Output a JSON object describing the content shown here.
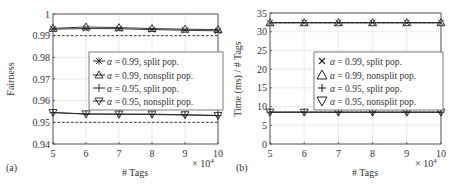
{
  "chart_data": [
    {
      "panel": "(a)",
      "type": "line",
      "xlabel": "# Tags",
      "ylabel": "Fairness",
      "x_multiplier": "× 10^4",
      "x": [
        5,
        6,
        7,
        8,
        9,
        10
      ],
      "x_ticks": [
        "5",
        "6",
        "7",
        "8",
        "9",
        "10"
      ],
      "ylim": [
        0.94,
        1.0
      ],
      "y_ticks": [
        "0.94",
        "0.95",
        "0.96",
        "0.97",
        "0.98",
        "0.99",
        "1"
      ],
      "y_tick_values": [
        0.94,
        0.95,
        0.96,
        0.97,
        0.98,
        0.99,
        1.0
      ],
      "grid": true,
      "reference_lines": [
        0.99,
        0.95
      ],
      "legend_position": "center-right",
      "series": [
        {
          "name": "α = 0.99, split pop.",
          "marker": "asterisk",
          "values": [
            0.993,
            0.9933,
            0.9932,
            0.9928,
            0.9925,
            0.9922
          ]
        },
        {
          "name": "α = 0.99, nonsplit pop.",
          "marker": "triangle-up",
          "values": [
            0.9934,
            0.994,
            0.9937,
            0.9933,
            0.993,
            0.9928
          ]
        },
        {
          "name": "α = 0.95, split pop.",
          "marker": "plus",
          "values": [
            0.9545,
            0.9538,
            0.9537,
            0.9536,
            0.9534,
            0.9531
          ]
        },
        {
          "name": "α = 0.95, nonsplit pop.",
          "marker": "triangle-down",
          "values": [
            0.9545,
            0.9539,
            0.9538,
            0.9538,
            0.9535,
            0.9532
          ]
        }
      ]
    },
    {
      "panel": "(b)",
      "type": "line",
      "xlabel": "# Tags",
      "ylabel": "Time (ms) / # Tags",
      "x_multiplier": "× 10^4",
      "x": [
        5,
        6,
        7,
        8,
        9,
        10
      ],
      "x_ticks": [
        "5",
        "6",
        "7",
        "8",
        "9",
        "10"
      ],
      "ylim": [
        0,
        35
      ],
      "y_ticks": [
        "0",
        "5",
        "10",
        "15",
        "20",
        "25",
        "30",
        "35"
      ],
      "y_tick_values": [
        0,
        5,
        10,
        15,
        20,
        25,
        30,
        35
      ],
      "grid": true,
      "reference_lines": [
        32.4,
        8.5
      ],
      "legend_position": "center-right",
      "series": [
        {
          "name": "α = 0.99, split pop.",
          "marker": "x",
          "values": [
            32.4,
            32.4,
            32.4,
            32.4,
            32.4,
            32.4
          ]
        },
        {
          "name": "α = 0.99, nonsplit pop.",
          "marker": "triangle-up",
          "values": [
            32.4,
            32.4,
            32.4,
            32.4,
            32.4,
            32.4
          ]
        },
        {
          "name": "α = 0.95, split pop.",
          "marker": "plus",
          "values": [
            8.5,
            8.5,
            8.5,
            8.5,
            8.5,
            8.5
          ]
        },
        {
          "name": "α = 0.95, nonsplit pop.",
          "marker": "triangle-down",
          "values": [
            8.5,
            8.5,
            8.5,
            8.5,
            8.5,
            8.5
          ]
        }
      ]
    }
  ],
  "panels": {
    "a": {
      "label": "(a)",
      "xlabel": "# Tags",
      "ylabel": "Fairness",
      "x_exp_base": "× 10",
      "x_exp_power": "4",
      "legend": [
        {
          "alpha": "α",
          "text": " = 0.99, split pop."
        },
        {
          "alpha": "α",
          "text": " = 0.99, nonsplit pop."
        },
        {
          "alpha": "α",
          "text": " = 0.95, split pop."
        },
        {
          "alpha": "α",
          "text": " = 0.95, nonsplit pop."
        }
      ]
    },
    "b": {
      "label": "(b)",
      "xlabel": "# Tags",
      "ylabel": "Time (ms) / # Tags",
      "x_exp_base": "× 10",
      "x_exp_power": "4",
      "legend": [
        {
          "alpha": "α",
          "text": " = 0.99, split pop."
        },
        {
          "alpha": "α",
          "text": " = 0.99, nonsplit pop."
        },
        {
          "alpha": "α",
          "text": " = 0.95, split pop."
        },
        {
          "alpha": "α",
          "text": " = 0.95, nonsplit pop."
        }
      ]
    }
  },
  "colors": {
    "axis": "#333333",
    "grid": "#e3e3e3",
    "line": "#222222",
    "reference": "#222222"
  }
}
